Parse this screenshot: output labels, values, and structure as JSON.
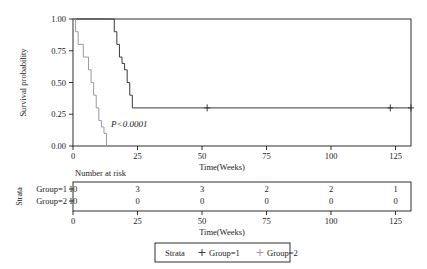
{
  "figure": {
    "type": "kaplan-meier-survival-plot"
  },
  "axes": {
    "y": {
      "label": "Survival probability",
      "ticks": [
        "0.00",
        "0.25",
        "0.50",
        "0.75",
        "1.00"
      ],
      "tick_values": [
        0.0,
        0.25,
        0.5,
        0.75,
        1.0
      ],
      "range": [
        0.0,
        1.0
      ]
    },
    "x": {
      "label": "Time(Weeks)",
      "ticks": [
        "0",
        "25",
        "50",
        "75",
        "100",
        "125"
      ],
      "tick_values": [
        0,
        25,
        50,
        75,
        100,
        125
      ],
      "range": [
        0,
        131
      ]
    }
  },
  "annotation": {
    "pvalue": "P<0.0001"
  },
  "risk_table": {
    "title": "Number at risk",
    "strata_axis_label": "Strata",
    "row_labels": [
      "Group=1",
      "Group=2"
    ],
    "x_label": "Time(Weeks)",
    "x_ticks": [
      "0",
      "25",
      "50",
      "75",
      "100",
      "125"
    ],
    "rows": [
      {
        "label": "Group=1",
        "counts": [
          "10",
          "3",
          "3",
          "2",
          "2",
          "1"
        ]
      },
      {
        "label": "Group=2",
        "counts": [
          "10",
          "0",
          "0",
          "0",
          "0",
          "0"
        ]
      }
    ]
  },
  "legend": {
    "title": "Strata",
    "marker": "+",
    "items": [
      {
        "label": "Group=1",
        "color": "#3a3a3a"
      },
      {
        "label": "Group=2",
        "color": "#9a9a9a"
      }
    ]
  },
  "colors": {
    "group1": "#3a3a3a",
    "group2": "#9a9a9a",
    "axis": "#1a1a1a",
    "background": "#ffffff"
  },
  "chart_data": {
    "type": "line",
    "title": "",
    "xlabel": "Time(Weeks)",
    "ylabel": "Survival probability",
    "xlim": [
      0,
      131
    ],
    "ylim": [
      0,
      1
    ],
    "grid": false,
    "legend_position": "bottom",
    "annotations": [
      {
        "text": "P<0.0001",
        "x": 14,
        "y": 0.17
      }
    ],
    "series": [
      {
        "name": "Group=1",
        "color": "#3a3a3a",
        "step": "post",
        "x": [
          0,
          15,
          16,
          17,
          18,
          19,
          20,
          21,
          22,
          23,
          131
        ],
        "y": [
          1.0,
          1.0,
          0.9,
          0.8,
          0.7,
          0.65,
          0.6,
          0.5,
          0.4,
          0.3,
          0.3
        ],
        "censored": [
          {
            "x": 52,
            "y": 0.3
          },
          {
            "x": 123,
            "y": 0.3
          },
          {
            "x": 131,
            "y": 0.3
          }
        ]
      },
      {
        "name": "Group=2",
        "color": "#9a9a9a",
        "step": "post",
        "x": [
          0,
          1,
          2,
          4,
          6,
          7,
          8,
          9,
          10,
          11,
          12,
          13
        ],
        "y": [
          1.0,
          0.9,
          0.8,
          0.7,
          0.6,
          0.5,
          0.4,
          0.3,
          0.2,
          0.15,
          0.1,
          0.0
        ],
        "censored": []
      }
    ]
  }
}
